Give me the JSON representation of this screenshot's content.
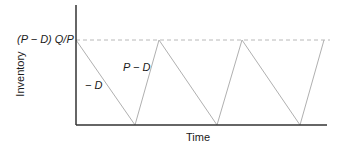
{
  "diagram": {
    "type": "inventory-sawtooth",
    "y_axis_label": "Inventory",
    "x_axis_label": "Time",
    "peak_level_label": "(P − D) Q/P",
    "depletion_slope_label": "− D",
    "buildup_slope_label": "P − D",
    "colors": {
      "axis": "#333333",
      "sawtooth": "#b0b0b0",
      "dashed_max": "#b8b8b8",
      "text": "#1a1a1a"
    },
    "geometry": {
      "origin": [
        76,
        125
      ],
      "y_axis_top": 5,
      "x_axis_end": 327,
      "max_level_y": 40,
      "sawtooth_points": [
        [
          76,
          40
        ],
        [
          135,
          125
        ],
        [
          159,
          40
        ],
        [
          217,
          125
        ],
        [
          242,
          40
        ],
        [
          300,
          125
        ],
        [
          324,
          40
        ]
      ]
    }
  }
}
